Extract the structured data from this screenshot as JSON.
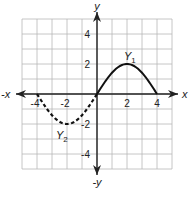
{
  "chart_data": {
    "type": "line",
    "title": "",
    "xlabel": "x",
    "ylabel": "y",
    "xlim": [
      -5,
      5
    ],
    "ylim": [
      -5,
      5
    ],
    "grid": true,
    "axis_labels": {
      "pos_x": "x",
      "neg_x": "-x",
      "pos_y": "y",
      "neg_y": "-y"
    },
    "x_ticks": [
      -4,
      -2,
      2,
      4
    ],
    "y_ticks": [
      4,
      2,
      -2,
      -4
    ],
    "x_tick_labels": [
      "-4",
      "-2",
      "2",
      "4"
    ],
    "y_tick_labels": [
      "4",
      "2",
      "-2",
      "-4"
    ],
    "series": [
      {
        "name": "Y1",
        "label_main": "Y",
        "label_sub": "1",
        "style": "solid",
        "x": [
          0,
          0.5,
          1,
          1.5,
          2,
          2.5,
          3,
          3.5,
          4
        ],
        "y": [
          0,
          0.77,
          1.41,
          1.85,
          2,
          1.85,
          1.41,
          0.77,
          0
        ]
      },
      {
        "name": "Y2",
        "label_main": "Y",
        "label_sub": "2",
        "style": "dashed",
        "x": [
          -4,
          -3.5,
          -3,
          -2.5,
          -2,
          -1.5,
          -1,
          -0.5,
          0
        ],
        "y": [
          0,
          -0.77,
          -1.41,
          -1.85,
          -2,
          -1.85,
          -1.41,
          -0.77,
          0
        ]
      }
    ],
    "colors": {
      "grid": "#b8b8b8",
      "axis": "#222222",
      "curve": "#111111"
    }
  }
}
